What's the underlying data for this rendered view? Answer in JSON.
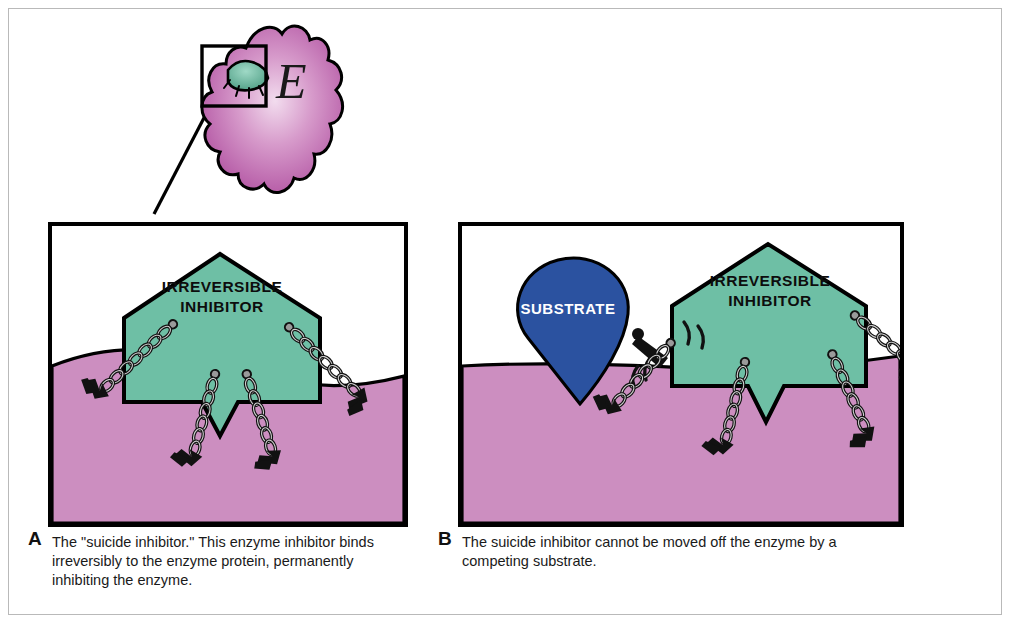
{
  "figure": {
    "colors": {
      "inhibitor_teal": "#6ebfa5",
      "enzyme_pink": "#cc8ec0",
      "substrate_blue": "#2b52a0",
      "outline_black": "#000000",
      "chain_gray": "#9a9a9a",
      "frame_gray": "#b9b9b9"
    }
  },
  "inset": {
    "enzyme_letter": "E",
    "callout_box_name": "magnified-active-site",
    "enzyme_fill": "#c06ab0",
    "inhibitor_fill": "#6ebfa5"
  },
  "panels": [
    {
      "letter": "A",
      "inhibitor_label_line1": "IRREVERSIBLE",
      "inhibitor_label_line2": "INHIBITOR",
      "caption": "The \"suicide inhibitor.\"  This enzyme inhibitor binds irreversibly to the enzyme protein, permanently inhibiting the enzyme.",
      "chain_count": 4
    },
    {
      "letter": "B",
      "inhibitor_label_line1": "IRREVERSIBLE",
      "inhibitor_label_line2": "INHIBITOR",
      "substrate_label": "SUBSTRATE",
      "caption": "The suicide inhibitor cannot be moved off the enzyme by a competing substrate.",
      "chain_count": 4
    }
  ]
}
